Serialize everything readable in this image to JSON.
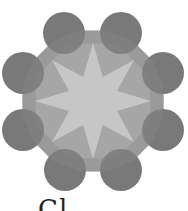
{
  "figure": {
    "center": [
      93,
      101
    ],
    "colors": {
      "circle": "#6e6e6e",
      "ring": "#9a9a9a",
      "ring_inner": "#b0b0b0",
      "star": "#c6c6c6",
      "background": "#ffffff"
    },
    "circles": [
      {
        "cx": 64,
        "cy": 33,
        "r": 21
      },
      {
        "cx": 121,
        "cy": 33,
        "r": 21
      },
      {
        "cx": 23,
        "cy": 73,
        "r": 21
      },
      {
        "cx": 163,
        "cy": 73,
        "r": 21
      },
      {
        "cx": 23,
        "cy": 130,
        "r": 21
      },
      {
        "cx": 163,
        "cy": 130,
        "r": 21
      },
      {
        "cx": 65,
        "cy": 170,
        "r": 21
      },
      {
        "cx": 121,
        "cy": 170,
        "r": 21
      }
    ],
    "ring_radius": 72,
    "star_points": 8,
    "star_outer_radius": 58,
    "star_inner_radius": 26
  },
  "caption": {
    "text": "Cl"
  }
}
